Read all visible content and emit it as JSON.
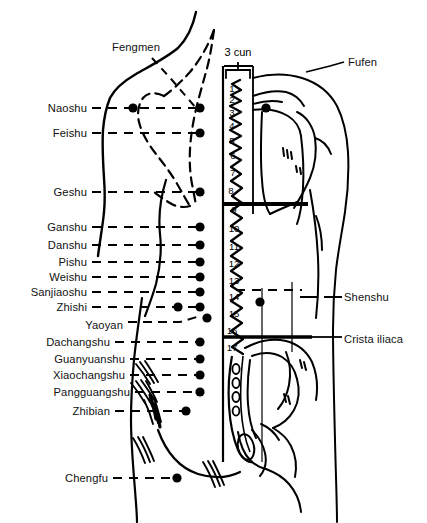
{
  "diagram": {
    "measure_label": "3 cun",
    "left_labels": [
      {
        "text": "Fengmen",
        "x": 112,
        "y": 47,
        "anchor": "start",
        "leader": "diagonal"
      },
      {
        "text": "Naoshu",
        "x": 87,
        "y": 108,
        "anchor": "end"
      },
      {
        "text": "Feishu",
        "x": 87,
        "y": 133,
        "anchor": "end"
      },
      {
        "text": "Geshu",
        "x": 87,
        "y": 192,
        "anchor": "end"
      },
      {
        "text": "Ganshu",
        "x": 87,
        "y": 227,
        "anchor": "end"
      },
      {
        "text": "Danshu",
        "x": 87,
        "y": 245,
        "anchor": "end"
      },
      {
        "text": "Pishu",
        "x": 87,
        "y": 262,
        "anchor": "end"
      },
      {
        "text": "Weishu",
        "x": 87,
        "y": 277,
        "anchor": "end"
      },
      {
        "text": "Sanjiaoshu",
        "x": 87,
        "y": 292,
        "anchor": "end"
      },
      {
        "text": "Zhishi",
        "x": 87,
        "y": 307,
        "anchor": "end"
      },
      {
        "text": "Yaoyan",
        "x": 123,
        "y": 325,
        "anchor": "end"
      },
      {
        "text": "Dachangshu",
        "x": 110,
        "y": 342,
        "anchor": "end"
      },
      {
        "text": "Guanyuanshu",
        "x": 125,
        "y": 359,
        "anchor": "end"
      },
      {
        "text": "Xiaochangshu",
        "x": 125,
        "y": 375,
        "anchor": "end"
      },
      {
        "text": "Pangguangshu",
        "x": 130,
        "y": 392,
        "anchor": "end"
      },
      {
        "text": "Zhibian",
        "x": 110,
        "y": 411,
        "anchor": "end"
      },
      {
        "text": "Chengfu",
        "x": 108,
        "y": 478,
        "anchor": "end"
      }
    ],
    "right_labels": [
      {
        "text": "Fufen",
        "x": 348,
        "y": 62,
        "anchor": "start"
      },
      {
        "text": "Shenshu",
        "x": 344,
        "y": 297,
        "anchor": "start"
      },
      {
        "text": "Crista iliaca",
        "x": 344,
        "y": 339,
        "anchor": "start"
      }
    ],
    "vertebra_numbers": [
      {
        "n": "1",
        "x": 232,
        "y": 88
      },
      {
        "n": "2",
        "x": 232,
        "y": 99
      },
      {
        "n": "3",
        "x": 232,
        "y": 112
      },
      {
        "n": "4",
        "x": 232,
        "y": 125
      },
      {
        "n": "5",
        "x": 232,
        "y": 140
      },
      {
        "n": "6",
        "x": 233,
        "y": 155
      },
      {
        "n": "7",
        "x": 233,
        "y": 172
      },
      {
        "n": "8",
        "x": 231,
        "y": 190
      },
      {
        "n": "9",
        "x": 234,
        "y": 209
      },
      {
        "n": "10",
        "x": 234,
        "y": 228
      },
      {
        "n": "11",
        "x": 234,
        "y": 246
      },
      {
        "n": "12",
        "x": 234,
        "y": 263
      },
      {
        "n": "13",
        "x": 234,
        "y": 280
      },
      {
        "n": "14",
        "x": 234,
        "y": 296
      },
      {
        "n": "15",
        "x": 234,
        "y": 313
      },
      {
        "n": "16",
        "x": 232,
        "y": 330
      },
      {
        "n": "17",
        "x": 232,
        "y": 347
      }
    ]
  },
  "chart_data": {
    "type": "diagram",
    "point_rows": [
      {
        "name": "Naoshu",
        "y": 108,
        "dots_x": [
          133,
          200
        ]
      },
      {
        "name": "Feishu",
        "y": 133,
        "dots_x": [
          200
        ]
      },
      {
        "name": "Geshu",
        "y": 192,
        "dots_x": [
          200
        ]
      },
      {
        "name": "Ganshu",
        "y": 227,
        "dots_x": [
          200
        ]
      },
      {
        "name": "Danshu",
        "y": 245,
        "dots_x": [
          200
        ]
      },
      {
        "name": "Pishu",
        "y": 262,
        "dots_x": [
          200
        ]
      },
      {
        "name": "Weishu",
        "y": 277,
        "dots_x": [
          200
        ]
      },
      {
        "name": "Sanjiaoshu",
        "y": 292,
        "dots_x": [
          200
        ]
      },
      {
        "name": "Zhishi",
        "y": 307,
        "dots_x": [
          178,
          200
        ]
      },
      {
        "name": "Yaoyan",
        "y": 318,
        "dots_x": [
          207
        ]
      },
      {
        "name": "Dachangshu",
        "y": 342,
        "dots_x": [
          200
        ]
      },
      {
        "name": "Guanyuanshu",
        "y": 359,
        "dots_x": [
          200
        ]
      },
      {
        "name": "Xiaochangshu",
        "y": 375,
        "dots_x": [
          200
        ]
      },
      {
        "name": "Pangguangshu",
        "y": 392,
        "dots_x": [
          200
        ]
      },
      {
        "name": "Zhibian",
        "y": 411,
        "dots_x": [
          186
        ]
      },
      {
        "name": "Chengfu",
        "y": 478,
        "dots_x": [
          177
        ]
      }
    ],
    "right_side_points": [
      {
        "name": "Fufen",
        "x": 266,
        "y": 108
      },
      {
        "name": "Shenshu",
        "x": 260,
        "y": 302
      }
    ],
    "reference_lines": [
      {
        "label": "scapula inferior angle",
        "y": 204,
        "x1": 224,
        "x2": 308
      },
      {
        "label": "Crista iliaca",
        "y": 337,
        "x1": 224,
        "x2": 310
      }
    ],
    "vertebrae_count": 17,
    "sacral_foramina": 4
  }
}
